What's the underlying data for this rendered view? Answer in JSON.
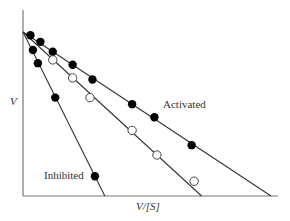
{
  "chart_data": {
    "type": "scatter",
    "title": "",
    "xlabel": "V/[S]",
    "ylabel": "V",
    "grid": false,
    "legend": "inline annotations",
    "xlim": [
      0,
      1.03
    ],
    "ylim": [
      0,
      1.13
    ],
    "series": [
      {
        "name": "Activated",
        "marker": "filled-circle",
        "line": {
          "y_intercept": 1.0,
          "x_intercept": 1.0
        },
        "points": [
          [
            0.03,
            0.98
          ],
          [
            0.07,
            0.94
          ],
          [
            0.12,
            0.88
          ],
          [
            0.2,
            0.8
          ],
          [
            0.28,
            0.71
          ],
          [
            0.44,
            0.56
          ],
          [
            0.53,
            0.48
          ],
          [
            0.68,
            0.31
          ]
        ]
      },
      {
        "name": "Control",
        "marker": "open-circle",
        "line": {
          "y_intercept": 1.0,
          "x_intercept": 0.72
        },
        "points": [
          [
            0.12,
            0.83
          ],
          [
            0.2,
            0.72
          ],
          [
            0.27,
            0.6
          ],
          [
            0.44,
            0.4
          ],
          [
            0.54,
            0.25
          ],
          [
            0.69,
            0.09
          ]
        ]
      },
      {
        "name": "Inhibited",
        "marker": "filled-circle",
        "line": {
          "y_intercept": 1.0,
          "x_intercept": 0.33
        },
        "points": [
          [
            0.04,
            0.89
          ],
          [
            0.06,
            0.81
          ],
          [
            0.13,
            0.6
          ],
          [
            0.29,
            0.12
          ]
        ]
      }
    ],
    "annotations": [
      {
        "text": "Activated",
        "near_series": "Activated"
      },
      {
        "text": "Inhibited",
        "near_series": "Inhibited"
      }
    ]
  },
  "labels": {
    "y_axis": "V",
    "x_axis": "V/[S]",
    "activated": "Activated",
    "inhibited": "Inhibited"
  }
}
